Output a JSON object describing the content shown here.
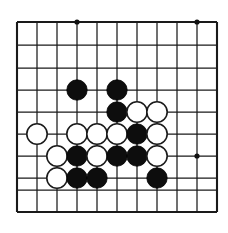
{
  "figure": {
    "kind": "go-board-diagram",
    "caption": ""
  },
  "board": {
    "columns": 11,
    "rows": 10,
    "origin_x": 17,
    "origin_y": 22,
    "spacing_x": 20,
    "spacing_y": 22,
    "last_row_y": 212,
    "line_color": "#1a1a1a",
    "background_color": "#ffffff",
    "border_width": 2.1,
    "line_width": 1.25,
    "x_positions": [
      17,
      37,
      57,
      77,
      97,
      117,
      137,
      157,
      177,
      197,
      217
    ],
    "y_positions": [
      22,
      45,
      68,
      90,
      112,
      134,
      156,
      178,
      190,
      212
    ],
    "star_points": [
      {
        "col": 3,
        "row": 0,
        "x": 77,
        "y": 22
      },
      {
        "col": 9,
        "row": 0,
        "x": 197,
        "y": 22
      },
      {
        "col": 9,
        "row": 6,
        "x": 197,
        "y": 156
      }
    ],
    "star_radius": 2.6,
    "stone_radius": 10.2
  },
  "stones": [
    {
      "color": "black",
      "col": 3,
      "row": 3,
      "x": 77,
      "y": 90
    },
    {
      "color": "black",
      "col": 5,
      "row": 3,
      "x": 117,
      "y": 90
    },
    {
      "color": "black",
      "col": 5,
      "row": 4,
      "x": 117,
      "y": 112
    },
    {
      "color": "white",
      "col": 6,
      "row": 4,
      "x": 137,
      "y": 112
    },
    {
      "color": "white",
      "col": 7,
      "row": 4,
      "x": 157,
      "y": 112
    },
    {
      "color": "white",
      "col": 1,
      "row": 5,
      "x": 37,
      "y": 134
    },
    {
      "color": "white",
      "col": 3,
      "row": 5,
      "x": 77,
      "y": 134
    },
    {
      "color": "white",
      "col": 4,
      "row": 5,
      "x": 97,
      "y": 134
    },
    {
      "color": "white",
      "col": 5,
      "row": 5,
      "x": 117,
      "y": 134
    },
    {
      "color": "black",
      "col": 6,
      "row": 5,
      "x": 137,
      "y": 134
    },
    {
      "color": "white",
      "col": 7,
      "row": 5,
      "x": 157,
      "y": 134
    },
    {
      "color": "white",
      "col": 2,
      "row": 6,
      "x": 57,
      "y": 156
    },
    {
      "color": "black",
      "col": 3,
      "row": 6,
      "x": 77,
      "y": 156
    },
    {
      "color": "white",
      "col": 4,
      "row": 6,
      "x": 97,
      "y": 156
    },
    {
      "color": "black",
      "col": 5,
      "row": 6,
      "x": 117,
      "y": 156
    },
    {
      "color": "black",
      "col": 6,
      "row": 6,
      "x": 137,
      "y": 156
    },
    {
      "color": "white",
      "col": 7,
      "row": 6,
      "x": 157,
      "y": 156
    },
    {
      "color": "white",
      "col": 2,
      "row": 7,
      "x": 57,
      "y": 178
    },
    {
      "color": "black",
      "col": 3,
      "row": 7,
      "x": 77,
      "y": 178
    },
    {
      "color": "black",
      "col": 4,
      "row": 7,
      "x": 97,
      "y": 178
    },
    {
      "color": "black",
      "col": 7,
      "row": 7,
      "x": 157,
      "y": 178
    }
  ],
  "counts": {
    "black_stones": 10,
    "white_stones": 11,
    "total_stones": 21
  },
  "colors": {
    "black_stone": "#0d0d0d",
    "white_stone": "#ffffff",
    "stone_outline": "#1a1a1a",
    "grid": "#1a1a1a",
    "star": "#111111",
    "page_background": "#ffffff"
  }
}
